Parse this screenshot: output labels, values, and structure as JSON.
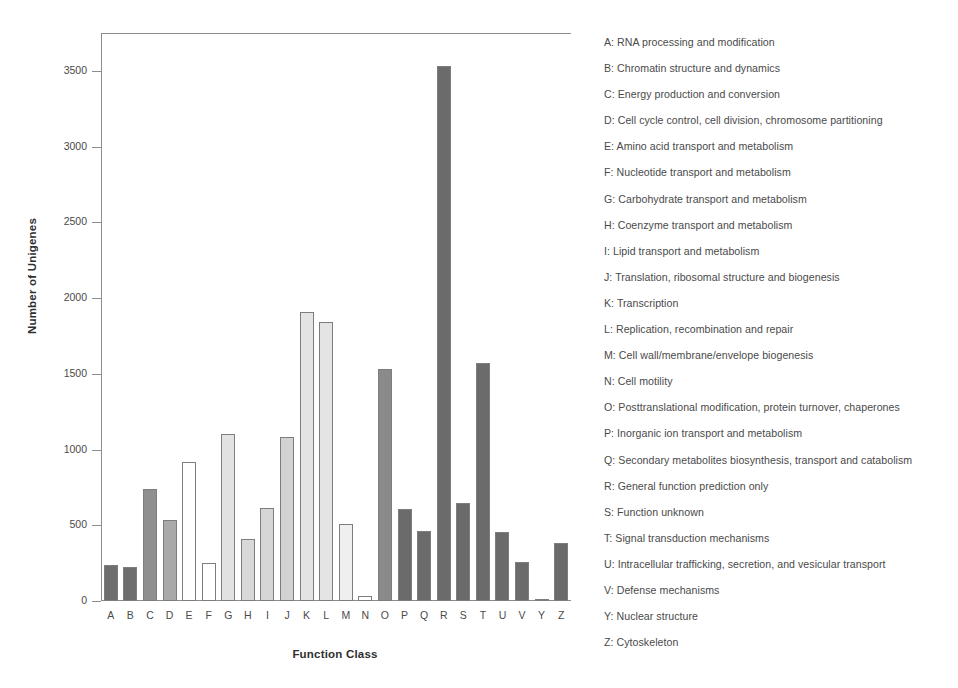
{
  "chart_data": {
    "type": "bar",
    "title": "",
    "xlabel": "Function Class",
    "ylabel": "Number of Unigenes",
    "categories": [
      "A",
      "B",
      "C",
      "D",
      "E",
      "F",
      "G",
      "H",
      "I",
      "J",
      "K",
      "L",
      "M",
      "N",
      "O",
      "P",
      "Q",
      "R",
      "S",
      "T",
      "U",
      "V",
      "Y",
      "Z"
    ],
    "values": [
      240,
      225,
      740,
      535,
      915,
      250,
      1105,
      410,
      615,
      1085,
      1910,
      1840,
      510,
      35,
      1535,
      605,
      460,
      3530,
      650,
      1570,
      455,
      260,
      15,
      385
    ],
    "bar_colors": [
      "#6e6e6e",
      "#6e6e6e",
      "#8f8f8f",
      "#a9a9a9",
      "#ffffff",
      "#ffffff",
      "#e2e2e2",
      "#d8d8d8",
      "#d6d6d6",
      "#d2d2d2",
      "#e4e4e4",
      "#e4e4e4",
      "#efefef",
      "#ffffff",
      "#8a8a8a",
      "#6b6b6b",
      "#6b6b6b",
      "#6b6b6b",
      "#6b6b6b",
      "#6b6b6b",
      "#6b6b6b",
      "#6b6b6b",
      "#6b6b6b",
      "#6b6b6b"
    ],
    "yticks": [
      0,
      500,
      1000,
      1500,
      2000,
      2500,
      3000,
      3500
    ],
    "ylim": [
      0,
      3750
    ],
    "grid": false,
    "legend_position": "right"
  },
  "axes": {
    "y_title": "Number of Unigenes",
    "x_title": "Function Class",
    "y_tick_labels": [
      "0",
      "500",
      "1000",
      "1500",
      "2000",
      "2500",
      "3000",
      "3500"
    ],
    "x_tick_labels": [
      "A",
      "B",
      "C",
      "D",
      "E",
      "F",
      "G",
      "H",
      "I",
      "J",
      "K",
      "L",
      "M",
      "N",
      "O",
      "P",
      "Q",
      "R",
      "S",
      "T",
      "U",
      "V",
      "Y",
      "Z"
    ]
  },
  "legend": {
    "items": [
      "A: RNA processing and modification",
      "B: Chromatin structure and dynamics",
      "C: Energy production and conversion",
      "D: Cell cycle control, cell division, chromosome partitioning",
      "E: Amino acid transport and metabolism",
      "F: Nucleotide transport and metabolism",
      "G: Carbohydrate transport and metabolism",
      "H: Coenzyme transport and metabolism",
      "I: Lipid transport and metabolism",
      "J: Translation, ribosomal structure and biogenesis",
      "K: Transcription",
      "L: Replication, recombination and repair",
      "M: Cell wall/membrane/envelope biogenesis",
      "N: Cell motility",
      "O: Posttranslational modification, protein turnover, chaperones",
      "P: Inorganic ion transport and metabolism",
      "Q: Secondary metabolites biosynthesis, transport and catabolism",
      "R: General function prediction only",
      "S: Function unknown",
      "T: Signal transduction mechanisms",
      "U: Intracellular trafficking, secretion, and vesicular transport",
      "V: Defense mechanisms",
      "Y: Nuclear structure",
      "Z: Cytoskeleton"
    ]
  }
}
